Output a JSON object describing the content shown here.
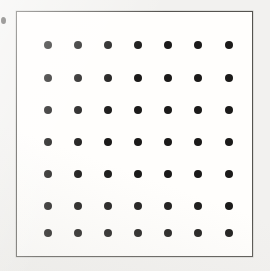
{
  "figure": {
    "canvas": {
      "width": 270,
      "height": 271,
      "background_color": "#f2f1ef"
    },
    "frame": {
      "x": 16,
      "y": 11,
      "width": 237,
      "height": 246,
      "border_color": "#55534f",
      "border_width": 1.6,
      "fill_color": "#fffefc"
    },
    "artifact": {
      "name": "edge-mark",
      "x": 1,
      "y": 17,
      "width": 5,
      "height": 7,
      "color": "#23211f"
    }
  },
  "chart_data": {
    "type": "scatter",
    "subtitle": "",
    "xlabel": "",
    "ylabel": "",
    "grid": false,
    "legend": "none",
    "rows": 7,
    "columns": 7,
    "point_count": 49,
    "marker": {
      "shape": "circle",
      "color": "#1b1a19",
      "diameter_px": 8.4
    },
    "xlim": [
      0,
      237
    ],
    "ylim": [
      0,
      246
    ],
    "column_centers_px": [
      31,
      61,
      91,
      121,
      151,
      181,
      212
    ],
    "row_centers_px": [
      33,
      66,
      98,
      130,
      162,
      194,
      221
    ],
    "x_spacing_px": 30.1,
    "y_spacing_px": 31.3,
    "x": [
      31,
      61,
      91,
      121,
      151,
      181,
      212,
      31,
      61,
      91,
      121,
      151,
      181,
      212,
      31,
      61,
      91,
      121,
      151,
      181,
      212,
      31,
      61,
      91,
      121,
      151,
      181,
      212,
      31,
      61,
      91,
      121,
      151,
      181,
      212,
      31,
      61,
      91,
      121,
      151,
      181,
      212,
      31,
      61,
      91,
      121,
      151,
      181,
      212
    ],
    "y": [
      33,
      33,
      33,
      33,
      33,
      33,
      33,
      66,
      66,
      66,
      66,
      66,
      66,
      66,
      98,
      98,
      98,
      98,
      98,
      98,
      98,
      130,
      130,
      130,
      130,
      130,
      130,
      130,
      162,
      162,
      162,
      162,
      162,
      162,
      162,
      194,
      194,
      194,
      194,
      194,
      194,
      194,
      221,
      221,
      221,
      221,
      221,
      221,
      221
    ]
  }
}
